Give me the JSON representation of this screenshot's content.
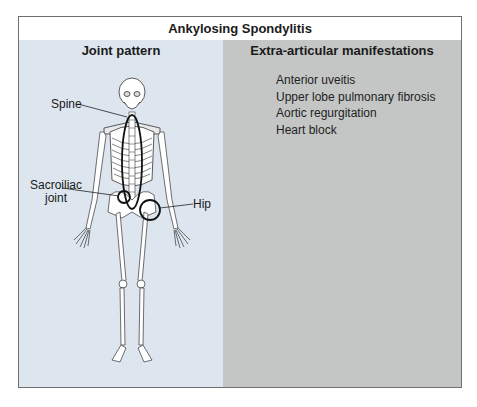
{
  "figure": {
    "title": "Ankylosing Spondylitis",
    "left_panel": {
      "heading": "Joint pattern",
      "labels": {
        "spine": "Spine",
        "sacroiliac_line1": "Sacroiliac",
        "sacroiliac_line2": "joint",
        "hip": "Hip"
      }
    },
    "right_panel": {
      "heading": "Extra-articular manifestations",
      "items": [
        "Anterior uveitis",
        "Upper lobe pulmonary fibrosis",
        "Aortic regurgitation",
        "Heart block"
      ]
    },
    "colors": {
      "left_bg": "#dde6ef",
      "right_bg": "#c4c6c6",
      "border": "#6f6f6f"
    }
  }
}
